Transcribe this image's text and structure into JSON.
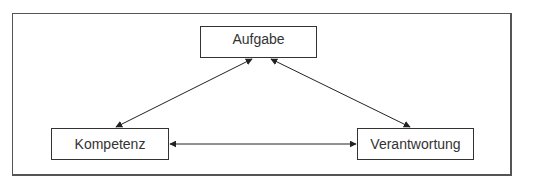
{
  "diagram": {
    "type": "triangle-relationship",
    "nodes": [
      {
        "id": "aufgabe",
        "label": "Aufgabe"
      },
      {
        "id": "kompetenz",
        "label": "Kompetenz"
      },
      {
        "id": "verantwortung",
        "label": "Verantwortung"
      }
    ],
    "edges": [
      {
        "from": "aufgabe",
        "to": "kompetenz",
        "direction": "bidirectional"
      },
      {
        "from": "aufgabe",
        "to": "verantwortung",
        "direction": "bidirectional"
      },
      {
        "from": "kompetenz",
        "to": "verantwortung",
        "direction": "bidirectional"
      }
    ],
    "colors": {
      "line": "#222222",
      "border": "#333333",
      "text": "#333333",
      "background": "#ffffff"
    }
  }
}
